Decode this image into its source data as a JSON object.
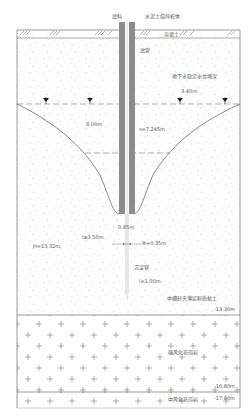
{
  "labels": {
    "filter_material": "滤料",
    "mixing_pile": "水泥土搅拌桩体",
    "fill_soil": "杂填土",
    "filter_tube": "滤管",
    "stable_water_depth": "地下水稳定水位埋深",
    "water_depth_value": "3.40m",
    "drawdown_radius": "8.00m",
    "drawdown_s": "s=7.245m",
    "pipe_gap": "0.85m",
    "filter_length": "l≥3.50m",
    "well_diameter": "Φ=0.35m",
    "well_depth": "H=13.32m",
    "sediment_pipe": "沉淀管",
    "sediment_length": "l=1.00m",
    "sand_layer": "中细砂夹薄层粉质黏土",
    "sand_bottom": "-13.30m",
    "strong_granite": "强风化花岗岩",
    "strong_granite_bottom": "-16.80m",
    "mid_granite": "中风化花岗岩",
    "mid_granite_top": "-17.80m"
  },
  "colors": {
    "line": "#555555",
    "pipe_fill": "#8c8c8c",
    "dot": "#b0b0b0"
  }
}
